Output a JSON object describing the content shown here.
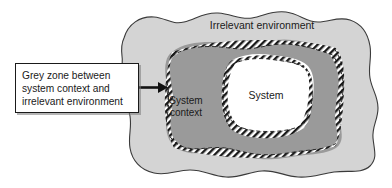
{
  "diagram": {
    "title_implicit": "System, system context and irrelevant environment",
    "labels": {
      "irrelevant_environment": "Irrelevant environment",
      "system_context_line1": "System",
      "system_context_line2": "context",
      "system": "System"
    },
    "callout": {
      "text": "Grey zone between\nsystem context and\nirrelevant environment"
    },
    "colors": {
      "outer_environment_fill": "#d4d4d4",
      "system_context_fill": "#9a9a9a",
      "system_fill": "#ffffff",
      "outline": "#3a3a3a",
      "hatch_stroke": "#1a1a1a",
      "callout_fill": "#ffffff",
      "callout_border": "#1a1a1a",
      "arrow": "#111111",
      "page_background": "#ffffff"
    },
    "regions": [
      {
        "name": "irrelevant-environment",
        "label": "Irrelevant environment",
        "fill": "#d4d4d4",
        "border_style": "solid-wavy"
      },
      {
        "name": "system-context",
        "label": "System context",
        "fill": "#9a9a9a",
        "border_style": "hatched-dashed"
      },
      {
        "name": "system",
        "label": "System",
        "fill": "#ffffff",
        "border_style": "hatched-dashed"
      }
    ]
  }
}
